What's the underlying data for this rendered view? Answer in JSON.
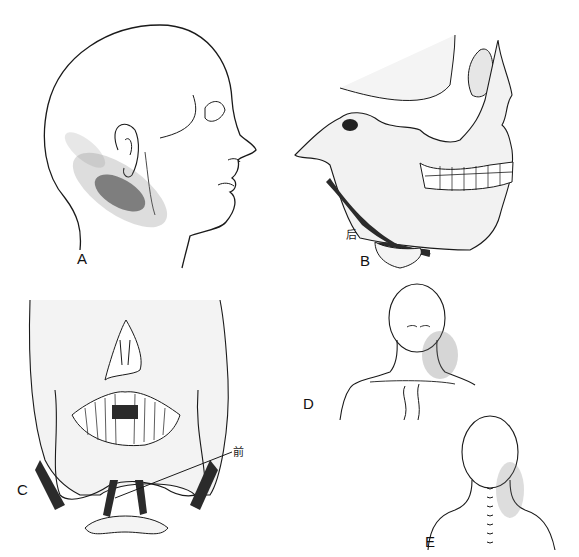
{
  "figure": {
    "panels": [
      {
        "id": "A",
        "label": "A",
        "description": "Lateral view of head with stippled pain referral pattern below ear along jaw and upper neck"
      },
      {
        "id": "B",
        "label": "B",
        "description": "Lateral view of skull with digastric muscle, posterior belly",
        "annotation": "后"
      },
      {
        "id": "C",
        "label": "C",
        "description": "Frontal view of skull and mandible with digastric muscles, anterior belly",
        "annotation": "前"
      },
      {
        "id": "D",
        "label": "D",
        "description": "Frontal view of head and neck with stippled referral over jaw and neck"
      },
      {
        "id": "E",
        "label": "E",
        "description": "Posterior view of head and neck with stippled referral along neck"
      }
    ]
  },
  "colors": {
    "ink": "#1a1a1a",
    "stipple": "#555555",
    "muscle": "#2b2b2b",
    "background": "#ffffff"
  }
}
